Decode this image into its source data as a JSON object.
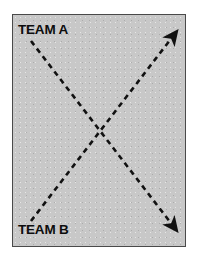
{
  "caption": {
    "text": "TWO TEAMS IN COLLISION:"
  },
  "diagram": {
    "background_color": "#c8c8c8",
    "border_color": "#4a4a4a",
    "line_color": "#111111",
    "labels": [
      {
        "id": "team-a",
        "text": "TEAM A"
      },
      {
        "id": "team-b",
        "text": "TEAM B"
      }
    ],
    "arrows": [
      {
        "id": "team-a-path",
        "label": "TEAM A",
        "style": "dashed",
        "from": {
          "x": 18,
          "y": 26
        },
        "to": {
          "x": 164,
          "y": 216
        },
        "arrowhead": "end",
        "direction": "down-right"
      },
      {
        "id": "team-b-path",
        "label": "TEAM B",
        "style": "dashed",
        "from": {
          "x": 18,
          "y": 206
        },
        "to": {
          "x": 164,
          "y": 16
        },
        "arrowhead": "end",
        "direction": "up-right"
      }
    ],
    "crossing_point": {
      "x": 90,
      "y": 116
    }
  }
}
